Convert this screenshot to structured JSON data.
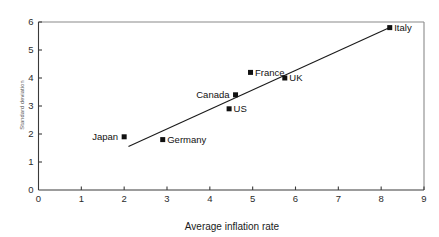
{
  "chart_data": {
    "type": "scatter",
    "title": "",
    "xlabel": "Average inflation rate",
    "ylabel": "Standard deviation",
    "xlim": [
      0,
      9
    ],
    "ylim": [
      0,
      6
    ],
    "xticks": [
      "0",
      "1",
      "2",
      "3",
      "4",
      "5",
      "6",
      "7",
      "8",
      "9"
    ],
    "yticks": [
      "0",
      "1",
      "2",
      "3",
      "4",
      "5",
      "6"
    ],
    "grid": false,
    "legend": "none",
    "points": [
      {
        "label": "Japan",
        "x": 2.0,
        "y": 1.9,
        "label_side": "left"
      },
      {
        "label": "Germany",
        "x": 2.9,
        "y": 1.8,
        "label_side": "right"
      },
      {
        "label": "US",
        "x": 4.45,
        "y": 2.9,
        "label_side": "right"
      },
      {
        "label": "Canada",
        "x": 4.6,
        "y": 3.4,
        "label_side": "left"
      },
      {
        "label": "France",
        "x": 4.95,
        "y": 4.2,
        "label_side": "right"
      },
      {
        "label": "UK",
        "x": 5.75,
        "y": 4.0,
        "label_side": "right"
      },
      {
        "label": "Italy",
        "x": 8.2,
        "y": 5.8,
        "label_side": "right"
      }
    ],
    "trend_line": {
      "x_start": 2.1,
      "y_start": 1.55,
      "x_end": 8.2,
      "y_end": 5.8
    },
    "colors": {
      "marker": "#111111",
      "trend_line": "#1a1a1a",
      "axis": "#3a3a3a",
      "frame": "#8a8a8a",
      "background": "#ffffff",
      "text": "#111111"
    }
  }
}
